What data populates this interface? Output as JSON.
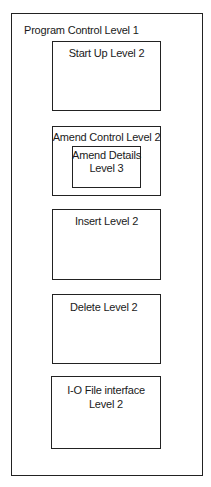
{
  "diagram": {
    "type": "nested-module-hierarchy",
    "outer": {
      "label": "Program Control Level 1"
    },
    "modules": [
      {
        "label": "Start Up Level 2"
      },
      {
        "label": "Amend Control Level 2",
        "children": [
          {
            "label_line1": "Amend Details",
            "label_line2": "Level 3"
          }
        ]
      },
      {
        "label": "Insert Level 2"
      },
      {
        "label": "Delete Level 2"
      },
      {
        "label_line1": "I-O File interface",
        "label_line2": "Level 2"
      }
    ]
  }
}
